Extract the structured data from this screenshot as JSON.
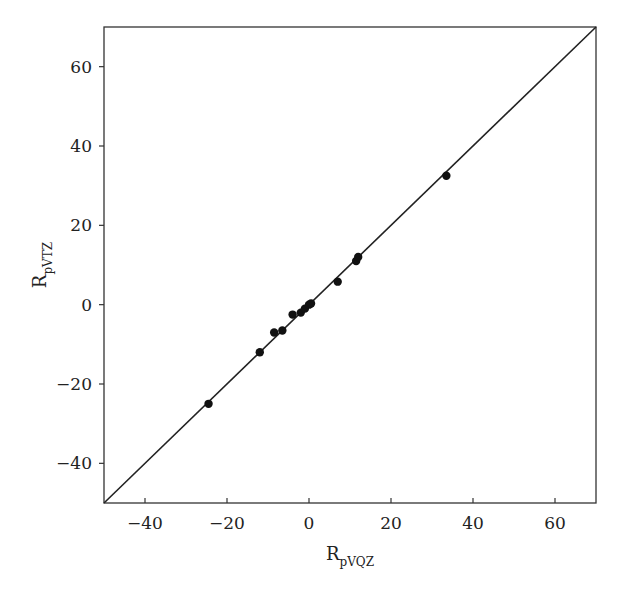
{
  "chart_data": {
    "type": "scatter",
    "title": "",
    "xlabel": "R_pVQZ",
    "ylabel": "R_pVTZ",
    "xlabel_main": "R",
    "xlabel_sub": "pVQZ",
    "ylabel_main": "R",
    "ylabel_sub": "pVTZ",
    "xlim": [
      -50,
      70
    ],
    "ylim": [
      -50,
      70
    ],
    "xticks": [
      -40,
      -20,
      0,
      20,
      40,
      60
    ],
    "yticks": [
      -40,
      -20,
      0,
      20,
      40,
      60
    ],
    "xtick_labels": [
      "−40",
      "−20",
      "0",
      "20",
      "40",
      "60"
    ],
    "ytick_labels": [
      "−40",
      "−20",
      "0",
      "20",
      "40",
      "60"
    ],
    "grid": false,
    "legend": null,
    "reference_line": {
      "type": "y=x",
      "from": [
        -50,
        -50
      ],
      "to": [
        70,
        70
      ]
    },
    "series": [
      {
        "name": "data",
        "color": "#111111",
        "points": [
          {
            "x": -24.5,
            "y": -25
          },
          {
            "x": -12,
            "y": -12
          },
          {
            "x": -8.5,
            "y": -7
          },
          {
            "x": -6.5,
            "y": -6.5
          },
          {
            "x": -4,
            "y": -2.5
          },
          {
            "x": -2,
            "y": -2
          },
          {
            "x": -1,
            "y": -1
          },
          {
            "x": 0,
            "y": 0
          },
          {
            "x": 0.5,
            "y": 0.3
          },
          {
            "x": 7,
            "y": 5.8
          },
          {
            "x": 11.5,
            "y": 11
          },
          {
            "x": 12,
            "y": 12
          },
          {
            "x": 33.5,
            "y": 32.5
          }
        ]
      }
    ]
  }
}
